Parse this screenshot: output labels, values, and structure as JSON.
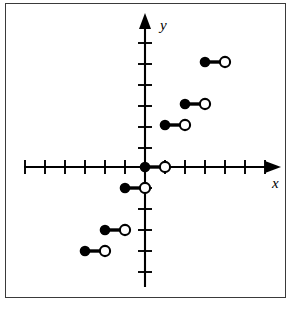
{
  "figure": {
    "kind": "coordinate-plane-graph",
    "axis_labels": {
      "x": "x",
      "y": "y"
    },
    "border_color": "#3a3a3a",
    "axis_color": "#000000",
    "point_fill_color": "#000000",
    "point_open_fill_color": "#ffffff"
  },
  "chart_data": {
    "type": "scatter",
    "title": "",
    "subtitle": "",
    "xlabel": "x",
    "ylabel": "y",
    "xlim": [
      -7,
      7
    ],
    "ylim": [
      -6,
      6
    ],
    "grid": false,
    "legend": null,
    "x_ticks": [
      -7,
      -6,
      -5,
      -4,
      -3,
      -2,
      -1,
      0,
      1,
      2,
      3,
      4,
      5,
      6,
      7
    ],
    "y_ticks": [
      -6,
      -5,
      -4,
      -3,
      -2,
      -1,
      0,
      1,
      2,
      3,
      4,
      5,
      6
    ],
    "x_tick_labels": [],
    "y_tick_labels": [],
    "series": [
      {
        "name": "step-segments",
        "style": "horizontal-segments-closed-left-open-right",
        "segments": [
          {
            "index": 0,
            "x_closed": -3,
            "x_open": -2,
            "y": -4
          },
          {
            "index": 1,
            "x_closed": -2,
            "x_open": -1,
            "y": -3
          },
          {
            "index": 2,
            "x_closed": -1,
            "x_open": 0,
            "y": -1
          },
          {
            "index": 3,
            "x_closed": 0,
            "x_open": 1,
            "y": 0
          },
          {
            "index": 4,
            "x_closed": 1,
            "x_open": 2,
            "y": 2
          },
          {
            "index": 5,
            "x_closed": 2,
            "x_open": 3,
            "y": 3
          },
          {
            "index": 6,
            "x_closed": 3,
            "x_open": 4,
            "y": 5
          }
        ]
      }
    ],
    "closed_points": [
      {
        "x": -3,
        "y": -4
      },
      {
        "x": -2,
        "y": -3
      },
      {
        "x": -1,
        "y": -1
      },
      {
        "x": 0,
        "y": 0
      },
      {
        "x": 1,
        "y": 2
      },
      {
        "x": 2,
        "y": 3
      },
      {
        "x": 3,
        "y": 5
      }
    ],
    "open_points": [
      {
        "x": -2,
        "y": -4
      },
      {
        "x": -1,
        "y": -3
      },
      {
        "x": 0,
        "y": -1
      },
      {
        "x": 1,
        "y": 0
      },
      {
        "x": 2,
        "y": 2
      },
      {
        "x": 3,
        "y": 3
      },
      {
        "x": 4,
        "y": 5
      }
    ]
  }
}
